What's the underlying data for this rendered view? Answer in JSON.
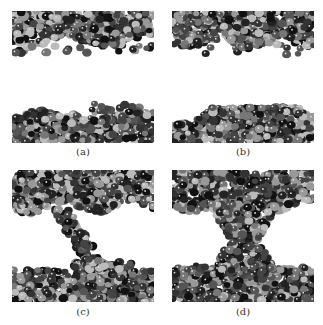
{
  "figure": {
    "panels": [
      {
        "id": "a",
        "label": "(a)",
        "state": "separated-layers"
      },
      {
        "id": "b",
        "label": "(b)",
        "state": "lower-bed-rising"
      },
      {
        "id": "c",
        "label": "(c)",
        "state": "diagonal-bridge"
      },
      {
        "id": "d",
        "label": "(d)",
        "state": "connected-column"
      }
    ]
  }
}
